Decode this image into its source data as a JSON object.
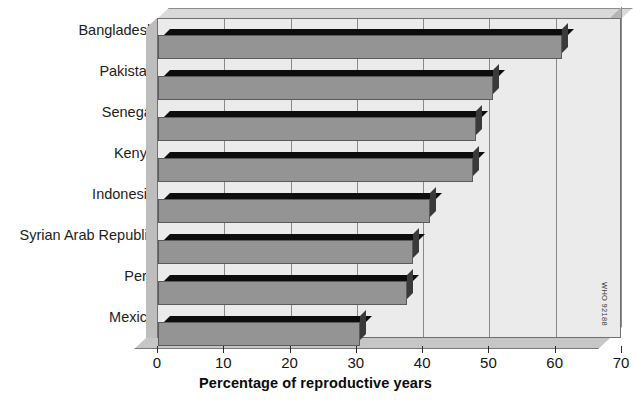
{
  "chart_data": {
    "type": "bar",
    "orientation": "horizontal",
    "title": "",
    "xlabel": "Percentage of reproductive years",
    "ylabel": "",
    "xlim": [
      0,
      70
    ],
    "xticks": [
      0,
      10,
      20,
      30,
      40,
      50,
      60,
      70
    ],
    "grid": true,
    "legend": false,
    "categories": [
      "Bangladesh",
      "Pakistan",
      "Senegal",
      "Kenya",
      "Indonesia",
      "Syrian Arab Republic",
      "Peru",
      "Mexico"
    ],
    "values": [
      61,
      50.5,
      48,
      47.5,
      41,
      38.5,
      37.5,
      30.5
    ],
    "series": [
      {
        "name": "Percentage of reproductive years",
        "values": [
          61,
          50.5,
          48,
          47.5,
          41,
          38.5,
          37.5,
          30.5
        ]
      }
    ],
    "bar_color": "#949494",
    "plot_background": "#ebebeb"
  },
  "axis": {
    "tick_labels": [
      "0",
      "10",
      "20",
      "30",
      "40",
      "50",
      "60",
      "70"
    ],
    "title": "Percentage of reproductive years"
  },
  "labels": {
    "bangladesh": "Bangladesh",
    "pakistan": "Pakistan",
    "senegal": "Senegal",
    "kenya": "Kenya",
    "indonesia": "Indonesia",
    "syrian_arab_republic": "Syrian Arab Republic",
    "peru": "Peru",
    "mexico": "Mexico"
  },
  "source_credit": "WHO 92188",
  "colors": {
    "bar": "#949494",
    "bar_top_shadow": "#0d0d0d",
    "bar_side_shadow": "#3a3a3a",
    "plot_bg": "#ebebeb",
    "grid": "#8a8a8a",
    "text": "#141414"
  }
}
